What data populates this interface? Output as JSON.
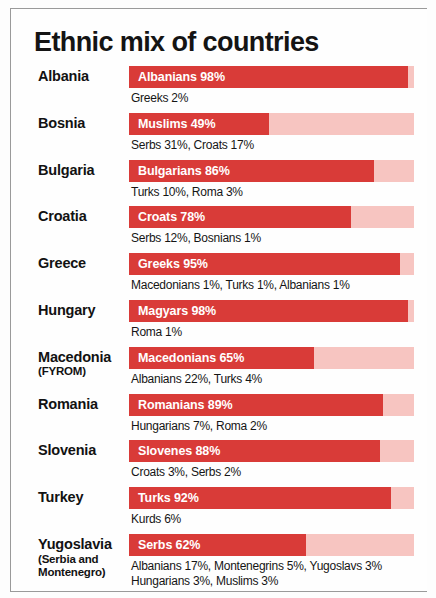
{
  "title": "Ethnic mix of countries",
  "colors": {
    "bar_major": "#d93b38",
    "bar_remainder": "#f7c5c1",
    "text": "#121212",
    "bar_label_text": "#ffffff",
    "frame": "#9a9a9a",
    "background": "#fefefe"
  },
  "chart_data": {
    "type": "bar",
    "title": "Ethnic mix of countries",
    "xlabel": "",
    "ylabel": "",
    "xlim": [
      0,
      100
    ],
    "grid": false,
    "legend": "none",
    "units": "percent of population",
    "categories": [
      "Albania",
      "Bosnia",
      "Bulgaria",
      "Croatia",
      "Greece",
      "Hungary",
      "Macedonia (FYROM)",
      "Romania",
      "Slovenia",
      "Turkey",
      "Yugoslavia (Serbia and Montenegro)"
    ],
    "values": [
      98,
      49,
      86,
      78,
      95,
      98,
      65,
      89,
      88,
      92,
      62
    ],
    "series": [
      {
        "name": "Majority ethnic group",
        "values": [
          98,
          49,
          86,
          78,
          95,
          98,
          65,
          89,
          88,
          92,
          62
        ]
      }
    ],
    "rows": [
      {
        "country": "Albania",
        "country_sub": "",
        "major_group": "Albanians",
        "major_percent": 98,
        "bar_label": "Albanians 98%",
        "minorities": [
          {
            "group": "Greeks",
            "percent": 2
          }
        ],
        "minorities_text": [
          "Greeks 2%"
        ]
      },
      {
        "country": "Bosnia",
        "country_sub": "",
        "major_group": "Muslims",
        "major_percent": 49,
        "bar_label": "Muslims 49%",
        "minorities": [
          {
            "group": "Serbs",
            "percent": 31
          },
          {
            "group": "Croats",
            "percent": 17
          }
        ],
        "minorities_text": [
          "Serbs 31%, Croats 17%"
        ]
      },
      {
        "country": "Bulgaria",
        "country_sub": "",
        "major_group": "Bulgarians",
        "major_percent": 86,
        "bar_label": "Bulgarians 86%",
        "minorities": [
          {
            "group": "Turks",
            "percent": 10
          },
          {
            "group": "Roma",
            "percent": 3
          }
        ],
        "minorities_text": [
          "Turks 10%, Roma 3%"
        ]
      },
      {
        "country": "Croatia",
        "country_sub": "",
        "major_group": "Croats",
        "major_percent": 78,
        "bar_label": "Croats 78%",
        "minorities": [
          {
            "group": "Serbs",
            "percent": 12
          },
          {
            "group": "Bosnians",
            "percent": 1
          }
        ],
        "minorities_text": [
          "Serbs 12%, Bosnians 1%"
        ]
      },
      {
        "country": "Greece",
        "country_sub": "",
        "major_group": "Greeks",
        "major_percent": 95,
        "bar_label": "Greeks 95%",
        "minorities": [
          {
            "group": "Macedonians",
            "percent": 1
          },
          {
            "group": "Turks",
            "percent": 1
          },
          {
            "group": "Albanians",
            "percent": 1
          }
        ],
        "minorities_text": [
          "Macedonians 1%, Turks 1%, Albanians 1%"
        ]
      },
      {
        "country": "Hungary",
        "country_sub": "",
        "major_group": "Magyars",
        "major_percent": 98,
        "bar_label": "Magyars 98%",
        "minorities": [
          {
            "group": "Roma",
            "percent": 1
          }
        ],
        "minorities_text": [
          "Roma 1%"
        ]
      },
      {
        "country": "Macedonia",
        "country_sub": "(FYROM)",
        "major_group": "Macedonians",
        "major_percent": 65,
        "bar_label": "Macedonians 65%",
        "minorities": [
          {
            "group": "Albanians",
            "percent": 22
          },
          {
            "group": "Turks",
            "percent": 4
          }
        ],
        "minorities_text": [
          "Albanians 22%, Turks 4%"
        ]
      },
      {
        "country": "Romania",
        "country_sub": "",
        "major_group": "Romanians",
        "major_percent": 89,
        "bar_label": "Romanians 89%",
        "minorities": [
          {
            "group": "Hungarians",
            "percent": 7
          },
          {
            "group": "Roma",
            "percent": 2
          }
        ],
        "minorities_text": [
          "Hungarians 7%, Roma 2%"
        ]
      },
      {
        "country": "Slovenia",
        "country_sub": "",
        "major_group": "Slovenes",
        "major_percent": 88,
        "bar_label": "Slovenes 88%",
        "minorities": [
          {
            "group": "Croats",
            "percent": 3
          },
          {
            "group": "Serbs",
            "percent": 2
          }
        ],
        "minorities_text": [
          "Croats 3%, Serbs 2%"
        ]
      },
      {
        "country": "Turkey",
        "country_sub": "",
        "major_group": "Turks",
        "major_percent": 92,
        "bar_label": "Turks 92%",
        "minorities": [
          {
            "group": "Kurds",
            "percent": 6
          }
        ],
        "minorities_text": [
          "Kurds 6%"
        ]
      },
      {
        "country": "Yugoslavia",
        "country_sub": "(Serbia and Montenegro)",
        "country_sub_lines": [
          "(Serbia and",
          "Montenegro)"
        ],
        "major_group": "Serbs",
        "major_percent": 62,
        "bar_label": "Serbs 62%",
        "minorities": [
          {
            "group": "Albanians",
            "percent": 17
          },
          {
            "group": "Montenegrins",
            "percent": 5
          },
          {
            "group": "Yugoslavs",
            "percent": 3
          },
          {
            "group": "Hungarians",
            "percent": 3
          },
          {
            "group": "Muslims",
            "percent": 3
          }
        ],
        "minorities_text": [
          "Albanians 17%, Montenegrins 5%, Yugoslavs 3%",
          "Hungarians 3%, Muslims 3%"
        ]
      }
    ]
  }
}
